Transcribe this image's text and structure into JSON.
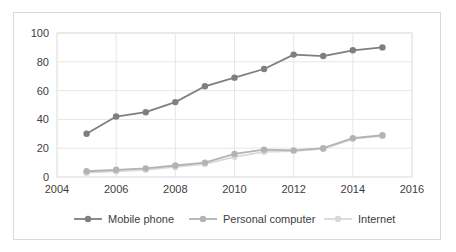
{
  "chart_data": {
    "type": "line",
    "title": "",
    "xlabel": "",
    "ylabel": "",
    "x": [
      2005,
      2006,
      2007,
      2008,
      2009,
      2010,
      2011,
      2012,
      2013,
      2014,
      2015
    ],
    "xlim": [
      2004,
      2016
    ],
    "ylim": [
      0,
      100
    ],
    "xticks": [
      "2004",
      "2006",
      "2008",
      "2010",
      "2012",
      "2014",
      "2016"
    ],
    "xtick_values": [
      2004,
      2006,
      2008,
      2010,
      2012,
      2014,
      2016
    ],
    "yticks": [
      "0",
      "20",
      "40",
      "60",
      "80",
      "100"
    ],
    "ytick_values": [
      0,
      20,
      40,
      60,
      80,
      100
    ],
    "grid": "horizontal-and-vertical",
    "legend_position": "bottom",
    "series": [
      {
        "name": "Mobile phone",
        "color": "#7f7f7f",
        "marker": "circle",
        "values": [
          30,
          42,
          45,
          52,
          63,
          69,
          75,
          85,
          84,
          88,
          90
        ]
      },
      {
        "name": "Personal computer",
        "color": "#b3b3b3",
        "marker": "circle",
        "values": [
          4,
          5,
          6,
          8,
          10,
          16,
          19,
          18.5,
          20,
          27,
          29
        ]
      },
      {
        "name": "Internet",
        "color": "#d9d9d9",
        "marker": "circle",
        "values": [
          3,
          4,
          5,
          7,
          9,
          14,
          17.5,
          18,
          19.5,
          26.5,
          28.5
        ]
      }
    ]
  },
  "legend": {
    "items": [
      {
        "label": "Mobile phone",
        "color": "#7f7f7f"
      },
      {
        "label": "Personal computer",
        "color": "#b3b3b3"
      },
      {
        "label": "Internet",
        "color": "#d9d9d9"
      }
    ]
  },
  "colors": {
    "plot_border": "#d9d9d9",
    "gridline": "#e6e6e6",
    "tick_text": "#404040",
    "background": "#ffffff"
  }
}
